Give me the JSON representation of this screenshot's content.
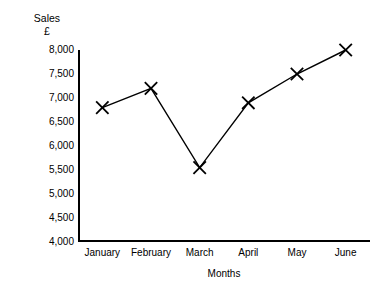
{
  "chart_data": {
    "type": "line",
    "title": "",
    "title_lines": [
      "Sales",
      "£"
    ],
    "xlabel": "Months",
    "ylabel": "Sales £",
    "categories": [
      "January",
      "February",
      "March",
      "April",
      "May",
      "June"
    ],
    "values": [
      6800,
      7200,
      5550,
      6900,
      7500,
      8000
    ],
    "series": [
      {
        "name": "Sales",
        "values": [
          6800,
          7200,
          5550,
          6900,
          7500,
          8000
        ]
      }
    ],
    "ylim": [
      4000,
      8000
    ],
    "ytick_values": [
      8000,
      7500,
      7000,
      6500,
      6000,
      5500,
      5000,
      4500,
      4000
    ],
    "ytick_labels": [
      "8,000",
      "7,500",
      "7,000",
      "6,500",
      "6,000",
      "5,500",
      "5,000",
      "4,500",
      "4,000"
    ],
    "grid": false,
    "legend": false,
    "legend_position": "none",
    "marker": "x",
    "line_color": "#000000",
    "marker_color": "#000000",
    "background_color": "#ffffff",
    "spines": [
      "left",
      "bottom"
    ]
  }
}
